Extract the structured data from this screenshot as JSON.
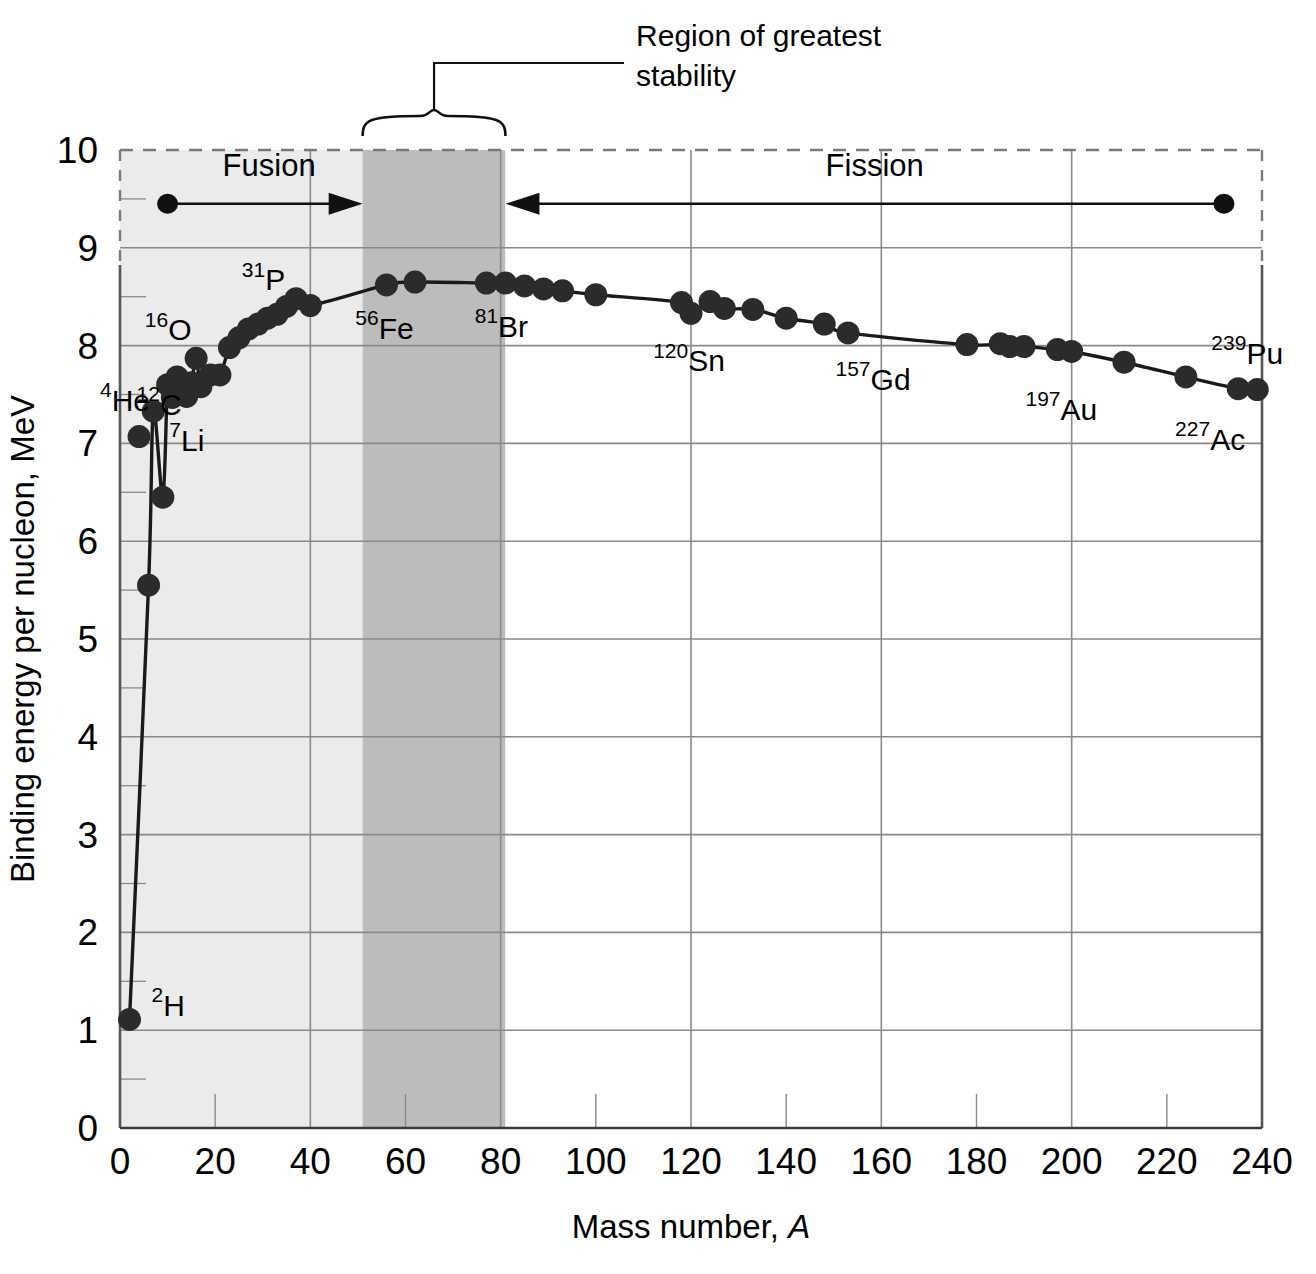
{
  "chart_data": {
    "type": "scatter",
    "title": "",
    "xlabel": "Mass number, A",
    "ylabel": "Binding energy per nucleon, MeV",
    "xlim": [
      0,
      240
    ],
    "ylim": [
      0,
      10
    ],
    "xticks": [
      0,
      20,
      40,
      60,
      80,
      100,
      120,
      140,
      160,
      180,
      200,
      220,
      240
    ],
    "yticks": [
      0,
      1,
      2,
      3,
      4,
      5,
      6,
      7,
      8,
      9,
      10
    ],
    "x_minor_step": 20,
    "y_minor_step": 0.5,
    "x_major_gridline_step": 40,
    "y_major_gridline_step": 1,
    "grid": true,
    "legend": "none",
    "series": [
      {
        "name": "Binding energy per nucleon",
        "points": [
          {
            "x": 2,
            "y": 1.11
          },
          {
            "x": 6,
            "y": 5.55
          },
          {
            "x": 9,
            "y": 6.45
          },
          {
            "x": 7,
            "y": 7.33
          },
          {
            "x": 10,
            "y": 7.6
          },
          {
            "x": 11,
            "y": 7.47
          },
          {
            "x": 12,
            "y": 7.68
          },
          {
            "x": 14,
            "y": 7.48
          },
          {
            "x": 13,
            "y": 7.6
          },
          {
            "x": 16,
            "y": 7.87
          },
          {
            "x": 15,
            "y": 7.62
          },
          {
            "x": 17,
            "y": 7.58
          },
          {
            "x": 19,
            "y": 7.7
          },
          {
            "x": 21,
            "y": 7.7
          },
          {
            "x": 23,
            "y": 7.98
          },
          {
            "x": 25,
            "y": 8.08
          },
          {
            "x": 27,
            "y": 8.17
          },
          {
            "x": 29,
            "y": 8.22
          },
          {
            "x": 31,
            "y": 8.28
          },
          {
            "x": 33,
            "y": 8.32
          },
          {
            "x": 35,
            "y": 8.4
          },
          {
            "x": 37,
            "y": 8.48
          },
          {
            "x": 40,
            "y": 8.41
          },
          {
            "x": 56,
            "y": 8.62
          },
          {
            "x": 62,
            "y": 8.65
          },
          {
            "x": 77,
            "y": 8.64
          },
          {
            "x": 81,
            "y": 8.64
          },
          {
            "x": 85,
            "y": 8.61
          },
          {
            "x": 89,
            "y": 8.58
          },
          {
            "x": 93,
            "y": 8.56
          },
          {
            "x": 100,
            "y": 8.52
          },
          {
            "x": 118,
            "y": 8.44
          },
          {
            "x": 120,
            "y": 8.33
          },
          {
            "x": 124,
            "y": 8.45
          },
          {
            "x": 127,
            "y": 8.38
          },
          {
            "x": 133,
            "y": 8.37
          },
          {
            "x": 140,
            "y": 8.28
          },
          {
            "x": 148,
            "y": 8.22
          },
          {
            "x": 153,
            "y": 8.13
          },
          {
            "x": 178,
            "y": 8.01
          },
          {
            "x": 185,
            "y": 8.02
          },
          {
            "x": 187,
            "y": 7.99
          },
          {
            "x": 190,
            "y": 7.99
          },
          {
            "x": 197,
            "y": 7.96
          },
          {
            "x": 200,
            "y": 7.94
          },
          {
            "x": 211,
            "y": 7.83
          },
          {
            "x": 224,
            "y": 7.68
          },
          {
            "x": 235,
            "y": 7.56
          },
          {
            "x": 239,
            "y": 7.55
          }
        ],
        "offcurve_points": [
          {
            "x": 4,
            "y": 7.07
          }
        ]
      }
    ],
    "point_labels": [
      {
        "sup": "2",
        "el": "H",
        "x": 2,
        "y": 1.11
      },
      {
        "sup": "4",
        "el": "He",
        "x": 4,
        "y": 7.07
      },
      {
        "sup": "7",
        "el": "Li",
        "x": 7,
        "y": 7.33
      },
      {
        "sup": "12",
        "el": "C",
        "x": 12,
        "y": 7.68
      },
      {
        "sup": "16",
        "el": "O",
        "x": 16,
        "y": 7.87
      },
      {
        "sup": "31",
        "el": "P",
        "x": 31,
        "y": 8.28
      },
      {
        "sup": "56",
        "el": "Fe",
        "x": 56,
        "y": 8.62
      },
      {
        "sup": "81",
        "el": "Br",
        "x": 81,
        "y": 8.64
      },
      {
        "sup": "120",
        "el": "Sn",
        "x": 120,
        "y": 8.33
      },
      {
        "sup": "157",
        "el": "Gd",
        "x": 157,
        "y": 8.1
      },
      {
        "sup": "197",
        "el": "Au",
        "x": 197,
        "y": 7.96
      },
      {
        "sup": "227",
        "el": "Ac",
        "x": 227,
        "y": 7.65
      },
      {
        "sup": "239",
        "el": "Pu",
        "x": 239,
        "y": 7.55
      }
    ],
    "shaded_bands": [
      {
        "name": "fusion-zone",
        "x0": 0,
        "x1": 51,
        "color": "#ebebeb"
      },
      {
        "name": "stability-band",
        "x0": 51,
        "x1": 81,
        "color": "#bcbcbc"
      },
      {
        "name": "fission-zone",
        "x0": 81,
        "x1": 240,
        "color": "#ffffff"
      }
    ],
    "annotations": {
      "region_label": "Region of greatest stability",
      "region_label_line1": "Region of greatest",
      "region_label_line2": "stability",
      "brace_x0": 51,
      "brace_x1": 81,
      "fusion": {
        "label": "Fusion",
        "from_x": 10,
        "to_x": 51,
        "y": 9.45,
        "direction": "right"
      },
      "fission": {
        "label": "Fission",
        "from_x": 232,
        "to_x": 81,
        "y": 9.45,
        "direction": "left"
      }
    },
    "colors": {
      "curve": "#1a1a1a",
      "marker": "#2b2b2b",
      "gridline": "#8a8a8a",
      "axis": "#555555",
      "fusion_zone": "#ebebeb",
      "stability_band": "#bcbcbc",
      "text": "#000000"
    }
  }
}
